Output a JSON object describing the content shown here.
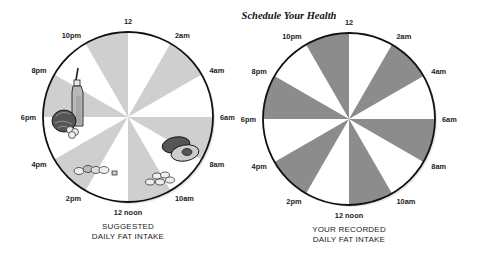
{
  "title": "Schedule Your Health",
  "colors": {
    "suggested_shade": "#cfcfcf",
    "recorded_shade": "#8c8c8c",
    "outline": "#111111",
    "background": "#ffffff"
  },
  "hour_labels": [
    "12",
    "2am",
    "4am",
    "6am",
    "8am",
    "10am",
    "12 noon",
    "2pm",
    "4pm",
    "6pm",
    "8pm",
    "10pm"
  ],
  "wheels": [
    {
      "id": "suggested",
      "caption_line1": "SUGGESTED",
      "caption_line2": "DAILY FAT INTAKE",
      "shaded_segments": [
        "10pm-12",
        "2am-4am",
        "6am-8am",
        "10am-12 noon",
        "2pm-4pm",
        "6pm-8pm"
      ],
      "illustrations": [
        "olive-oil-bottle",
        "lettuce",
        "garlic",
        "avocado",
        "nuts-cluster",
        "almonds"
      ]
    },
    {
      "id": "recorded",
      "caption_line1": "YOUR RECORDED",
      "caption_line2": "DAILY FAT INTAKE",
      "shaded_segments": [
        "10pm-12",
        "2am-4am",
        "6am-8am",
        "10am-12 noon",
        "2pm-4pm",
        "6pm-8pm"
      ],
      "illustrations": []
    }
  ]
}
